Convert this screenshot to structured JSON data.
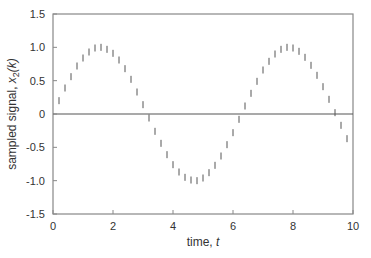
{
  "chart_data": {
    "type": "scatter",
    "title": "",
    "xlabel": "time, t",
    "ylabel": "sampled signal, x2(k)",
    "xlabel_parts": {
      "text": "time, ",
      "var": "t"
    },
    "ylabel_parts": {
      "text": "sampled signal, ",
      "var": "x",
      "sub": "2",
      "arg": "(k)"
    },
    "xlim": [
      0,
      10
    ],
    "ylim": [
      -1.5,
      1.5
    ],
    "xticks": [
      0,
      2,
      4,
      6,
      8,
      10
    ],
    "xtick_labels": [
      "0",
      "2",
      "4",
      "6",
      "8",
      "10"
    ],
    "yticks": [
      1.5,
      1.0,
      0.5,
      0,
      -0.5,
      -1.0,
      -1.5
    ],
    "ytick_labels": [
      "1.5",
      "1.0",
      "0.5",
      "0",
      "-0.5",
      "-1.0",
      "-1.5"
    ],
    "grid": false,
    "legend": null,
    "zero_line": true,
    "marker": "vertical-tick",
    "series": [
      {
        "name": "x2(k) = sin(t), sampled every 0.2",
        "x": [
          0.2,
          0.4,
          0.6,
          0.8,
          1.0,
          1.2,
          1.4,
          1.6,
          1.8,
          2.0,
          2.2,
          2.4,
          2.6,
          2.8,
          3.0,
          3.2,
          3.4,
          3.6,
          3.8,
          4.0,
          4.2,
          4.4,
          4.6,
          4.8,
          5.0,
          5.2,
          5.4,
          5.6,
          5.8,
          6.0,
          6.2,
          6.4,
          6.6,
          6.8,
          7.0,
          7.2,
          7.4,
          7.6,
          7.8,
          8.0,
          8.2,
          8.4,
          8.6,
          8.8,
          9.0,
          9.2,
          9.4,
          9.6,
          9.8
        ],
        "y": [
          0.2,
          0.39,
          0.56,
          0.72,
          0.84,
          0.93,
          0.99,
          1.0,
          0.97,
          0.91,
          0.81,
          0.68,
          0.52,
          0.33,
          0.14,
          -0.06,
          -0.26,
          -0.44,
          -0.61,
          -0.76,
          -0.87,
          -0.95,
          -0.99,
          -1.0,
          -0.96,
          -0.88,
          -0.77,
          -0.63,
          -0.46,
          -0.28,
          -0.08,
          0.12,
          0.31,
          0.49,
          0.66,
          0.79,
          0.9,
          0.97,
          1.0,
          0.99,
          0.94,
          0.85,
          0.73,
          0.58,
          0.41,
          0.22,
          0.02,
          -0.17,
          -0.37
        ]
      }
    ]
  },
  "colors": {
    "axes": "#888888",
    "markers": "#555555",
    "zero_line": "#555555",
    "text": "#333333"
  }
}
